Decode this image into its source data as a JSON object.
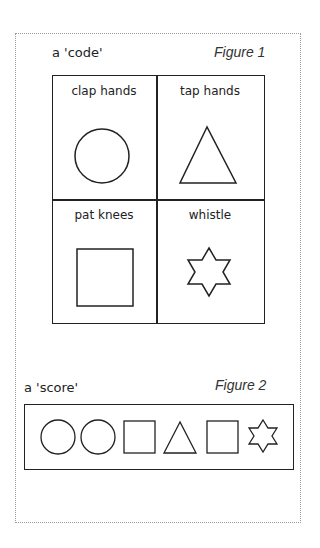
{
  "figure1": {
    "title": "a 'code'",
    "caption": "Figure 1",
    "cells": [
      {
        "label": "clap hands",
        "shape": "circle"
      },
      {
        "label": "tap hands",
        "shape": "triangle"
      },
      {
        "label": "pat knees",
        "shape": "square"
      },
      {
        "label": "whistle",
        "shape": "star"
      }
    ]
  },
  "figure2": {
    "title": "a 'score'",
    "caption": "Figure 2",
    "sequence": [
      "circle",
      "circle",
      "square",
      "triangle",
      "square",
      "star"
    ]
  },
  "colors": {
    "ink": "#222222",
    "frame": "#9a9a9a"
  }
}
